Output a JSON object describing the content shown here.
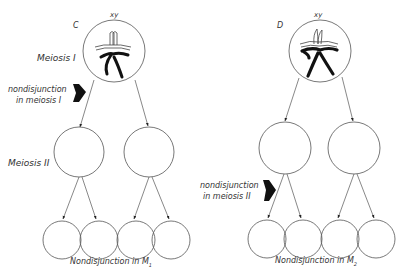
{
  "panels": [
    {
      "id": "C",
      "letter": "C",
      "genotype": "xy",
      "stage1_label": "Meiosis I",
      "stage2_label": "Meiosis II",
      "nondisjunction_label_line1": "nondisjunction",
      "nondisjunction_label_line2": "in meiosis I",
      "caption": "Nondisjunction in M",
      "caption_sub": "1"
    },
    {
      "id": "D",
      "letter": "D",
      "genotype": "xy",
      "nondisjunction_label_line1": "nondisjunction",
      "nondisjunction_label_line2": "in meiosis II",
      "caption": "Nondisjunction in M",
      "caption_sub": "2"
    }
  ],
  "colors": {
    "line": "#555555",
    "chromosome": "#111111",
    "arrow_block": "#111111"
  }
}
